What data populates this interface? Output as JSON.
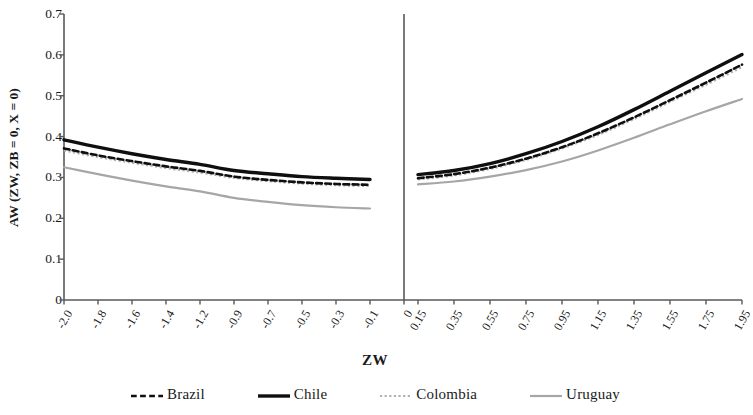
{
  "chart_data": {
    "type": "line",
    "title": "",
    "xlabel": "ZW",
    "ylabel": "AW (ZW, ZB = 0, X = 0)",
    "ylim": [
      0,
      0.7
    ],
    "yticks": [
      "0",
      "0.1",
      "0.2",
      "0.3",
      "0.4",
      "0.5",
      "0.6",
      "0.7"
    ],
    "ytick_values": [
      0,
      0.1,
      0.2,
      0.3,
      0.4,
      0.5,
      0.6,
      0.7
    ],
    "grid": false,
    "legend_position": "bottom",
    "panels": [
      {
        "name": "negative-panel",
        "xtick_labels": [
          "-2.0",
          "-1.8",
          "-1.6",
          "-1.4",
          "-1.2",
          "-0.9",
          "-0.7",
          "-0.5",
          "-0.3",
          "-0.1",
          "0"
        ],
        "x": [
          -2.0,
          -1.8,
          -1.6,
          -1.4,
          -1.2,
          -0.9,
          -0.7,
          -0.5,
          -0.3,
          -0.1
        ],
        "series": [
          {
            "name": "Chile",
            "values": [
              0.392,
              0.374,
              0.358,
              0.344,
              0.332,
              0.317,
              0.309,
              0.302,
              0.298,
              0.295
            ]
          },
          {
            "name": "Brazil",
            "values": [
              0.371,
              0.354,
              0.34,
              0.327,
              0.316,
              0.302,
              0.294,
              0.288,
              0.284,
              0.282
            ]
          },
          {
            "name": "Colombia",
            "values": [
              0.366,
              0.35,
              0.336,
              0.323,
              0.312,
              0.299,
              0.291,
              0.285,
              0.281,
              0.279
            ]
          },
          {
            "name": "Uruguay",
            "values": [
              0.325,
              0.308,
              0.292,
              0.278,
              0.266,
              0.25,
              0.24,
              0.232,
              0.227,
              0.224
            ]
          }
        ]
      },
      {
        "name": "positive-panel",
        "xtick_labels": [
          "0.15",
          "0.35",
          "0.55",
          "0.75",
          "0.95",
          "1.15",
          "1.35",
          "1.55",
          "1.75",
          "1.95"
        ],
        "x": [
          0.15,
          0.35,
          0.55,
          0.75,
          0.95,
          1.15,
          1.35,
          1.55,
          1.75,
          1.95
        ],
        "series": [
          {
            "name": "Chile",
            "values": [
              0.307,
              0.317,
              0.334,
              0.358,
              0.388,
              0.424,
              0.466,
              0.511,
              0.556,
              0.601
            ]
          },
          {
            "name": "Brazil",
            "values": [
              0.298,
              0.308,
              0.324,
              0.346,
              0.374,
              0.408,
              0.447,
              0.489,
              0.532,
              0.576
            ]
          },
          {
            "name": "Colombia",
            "values": [
              0.295,
              0.305,
              0.321,
              0.343,
              0.371,
              0.404,
              0.443,
              0.485,
              0.527,
              0.57
            ]
          },
          {
            "name": "Uruguay",
            "values": [
              0.283,
              0.29,
              0.302,
              0.318,
              0.339,
              0.366,
              0.397,
              0.43,
              0.462,
              0.492
            ]
          }
        ]
      }
    ],
    "legend": [
      {
        "label": "Brazil",
        "color": "#0f0f0f",
        "style": "dashed",
        "width": 2.6
      },
      {
        "label": "Chile",
        "color": "#0f0f0f",
        "style": "solid",
        "width": 3.4
      },
      {
        "label": "Colombia",
        "color": "#b0b0b0",
        "style": "dotted",
        "width": 2.2
      },
      {
        "label": "Uruguay",
        "color": "#a6a6a6",
        "style": "solid",
        "width": 2.2
      }
    ],
    "axis_color": "#595959",
    "divider_label": "0"
  }
}
